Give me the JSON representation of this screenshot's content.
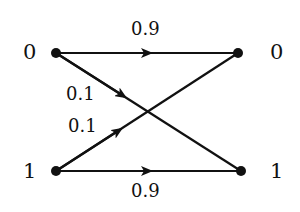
{
  "diagram": {
    "type": "binary-symmetric-channel",
    "inputs": [
      "0",
      "1"
    ],
    "outputs": [
      "0",
      "1"
    ],
    "edges": [
      {
        "from": "0",
        "to": "0",
        "label": "0.9"
      },
      {
        "from": "0",
        "to": "1",
        "label": "0.1"
      },
      {
        "from": "1",
        "to": "0",
        "label": "0.1"
      },
      {
        "from": "1",
        "to": "1",
        "label": "0.9"
      }
    ],
    "colors": {
      "stroke": "#111111",
      "background": "#ffffff"
    }
  }
}
